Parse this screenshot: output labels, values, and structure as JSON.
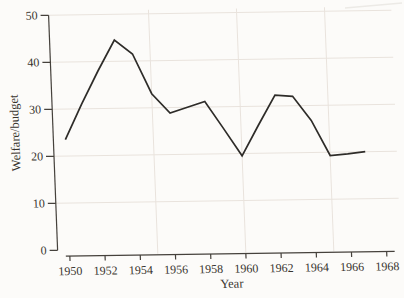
{
  "figure": {
    "background_color": "#fcfbf9",
    "line_color": "#2e2c29",
    "axis_color": "#45413c",
    "grid_color": "#e9e3dd",
    "text_color": "#38342e",
    "scan_artifact_color": "#eceae6"
  },
  "chart_data": {
    "type": "line",
    "title": "",
    "xlabel": "Year",
    "ylabel": "Welfare/budget",
    "x": [
      1950,
      1951,
      1952,
      1953,
      1954,
      1955,
      1956,
      1957,
      1958,
      1959,
      1960,
      1961,
      1962,
      1963,
      1964,
      1965,
      1966,
      1967
    ],
    "values": [
      23.5,
      31,
      38,
      44.5,
      41.5,
      33,
      28.8,
      30,
      31.2,
      25.4,
      19.5,
      26,
      32.3,
      32,
      26.8,
      19.3,
      19.6,
      20
    ],
    "series_name": "Welfare share of budget",
    "xlim": [
      1950,
      1968
    ],
    "ylim": [
      0,
      50
    ],
    "xticks": [
      1950,
      1952,
      1954,
      1956,
      1958,
      1960,
      1962,
      1964,
      1966,
      1968
    ],
    "yticks": [
      0,
      10,
      20,
      30,
      40,
      50
    ],
    "grid": {
      "on": true,
      "h_lines": [
        10,
        20,
        30,
        40,
        50
      ],
      "v_lines": [
        1955,
        1960,
        1965
      ]
    },
    "legend": {
      "shown": false
    }
  }
}
